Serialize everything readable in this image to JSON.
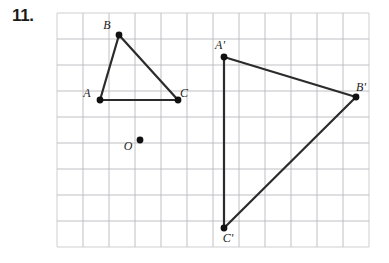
{
  "problem": {
    "number_label": "11."
  },
  "figure": {
    "type": "geometry-dilation-diagram",
    "grid": {
      "x": 57,
      "y": 13,
      "cols": 12,
      "rows": 9,
      "cell": 26,
      "line_color": "#b9b9bd",
      "border_color": "#c9c9cd"
    },
    "styles": {
      "segment_color": "#2b2b2b",
      "segment_width": 2.2,
      "vertex_color": "#111111",
      "vertex_radius": 3.4,
      "center_radius": 3.4
    },
    "points": [
      {
        "name": "A",
        "label": "A",
        "x": 100,
        "y": 100,
        "label_dx": -13,
        "label_dy": -3
      },
      {
        "name": "B",
        "label": "B",
        "x": 119,
        "y": 35,
        "label_dx": -12,
        "label_dy": -6
      },
      {
        "name": "C",
        "label": "C",
        "x": 178,
        "y": 100,
        "label_dx": 6,
        "label_dy": -3
      },
      {
        "name": "O",
        "label": "O",
        "x": 140,
        "y": 140,
        "label_dx": -12,
        "label_dy": 10
      },
      {
        "name": "A'",
        "label": "A'",
        "x": 224,
        "y": 57,
        "label_dx": -4,
        "label_dy": -8
      },
      {
        "name": "B'",
        "label": "B'",
        "x": 356,
        "y": 97,
        "label_dx": 5,
        "label_dy": -6
      },
      {
        "name": "C'",
        "label": "C'",
        "x": 224,
        "y": 228,
        "label_dx": 4,
        "label_dy": 14
      }
    ],
    "segments": [
      {
        "name": "segment-AB",
        "from": "A",
        "to": "B"
      },
      {
        "name": "segment-BC",
        "from": "B",
        "to": "C"
      },
      {
        "name": "segment-AC",
        "from": "A",
        "to": "C"
      },
      {
        "name": "segment-A1B1",
        "from": "A'",
        "to": "B'"
      },
      {
        "name": "segment-B1C1",
        "from": "B'",
        "to": "C'"
      },
      {
        "name": "segment-A1C1",
        "from": "A'",
        "to": "C'"
      }
    ]
  }
}
